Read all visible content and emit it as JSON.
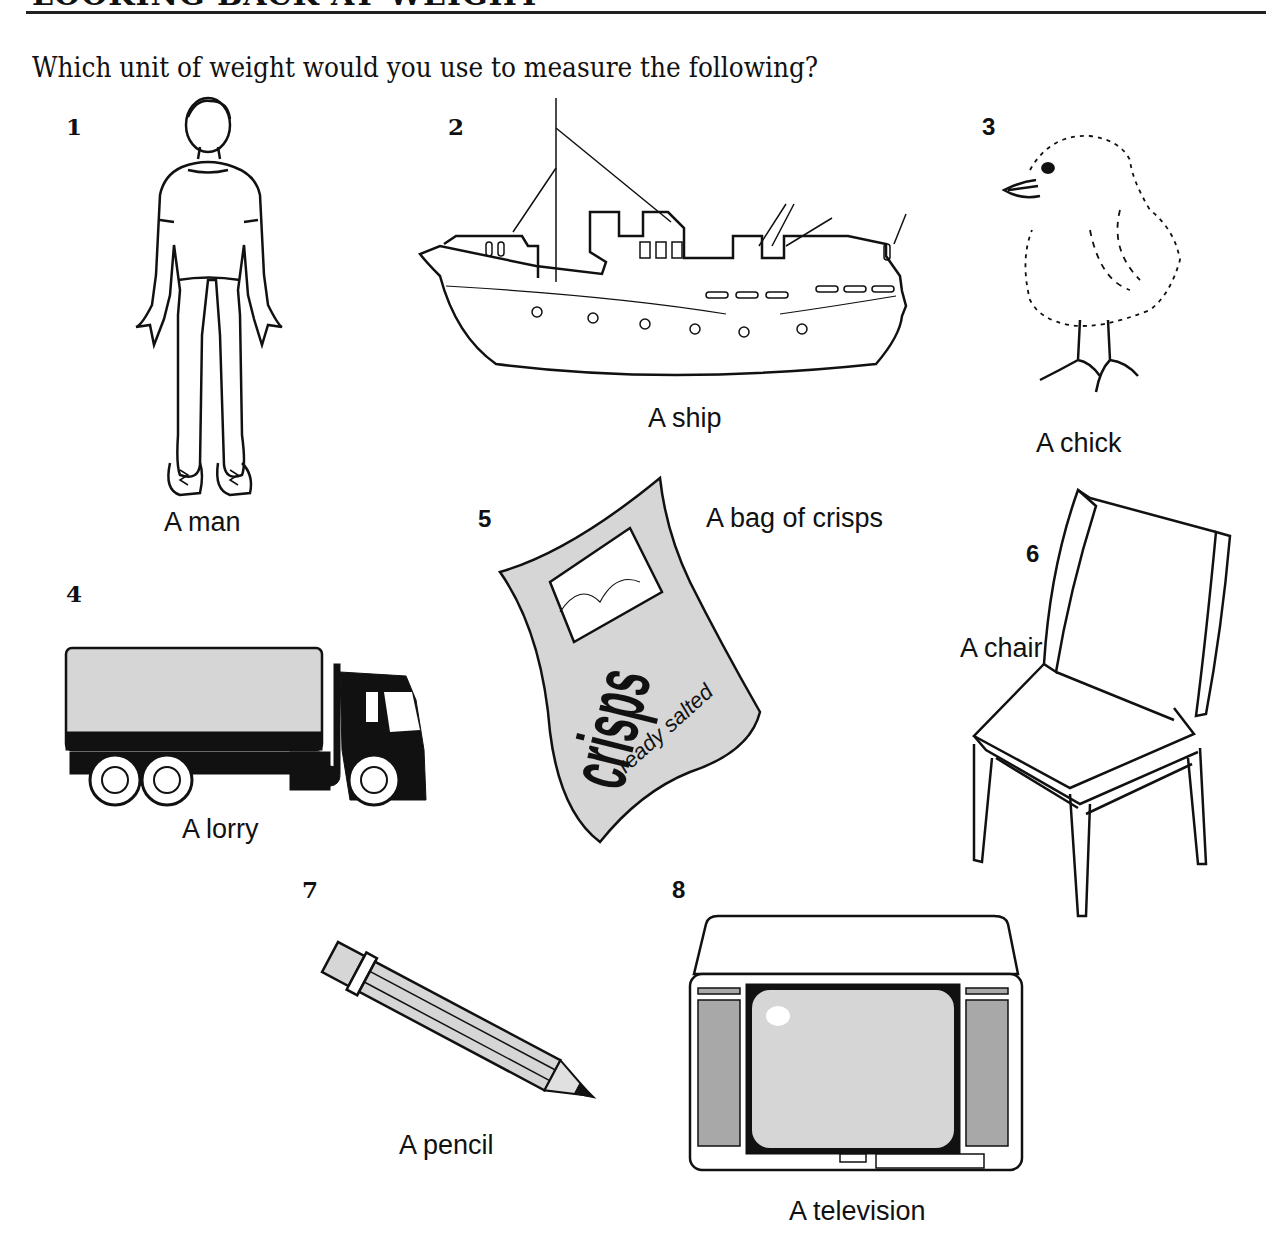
{
  "header": {
    "title": "LOOKING BACK AT WEIGHT",
    "question": "Which unit of weight would you use to measure the following?"
  },
  "items": [
    {
      "number": "1",
      "label": "A man",
      "icon": "man-figure"
    },
    {
      "number": "2",
      "label": "A ship",
      "icon": "ship"
    },
    {
      "number": "3",
      "label": "A chick",
      "icon": "chick"
    },
    {
      "number": "4",
      "label": "A lorry",
      "icon": "lorry"
    },
    {
      "number": "5",
      "label": "A bag of crisps",
      "icon": "crisps-bag",
      "packet_text": "crisps",
      "packet_subtext": "ready salted"
    },
    {
      "number": "6",
      "label": "A chair",
      "icon": "chair"
    },
    {
      "number": "7",
      "label": "A pencil",
      "icon": "pencil"
    },
    {
      "number": "8",
      "label": "A television",
      "icon": "television"
    }
  ],
  "colors": {
    "ink": "#111111",
    "grey_fill": "#d6d6d6",
    "dark_grey": "#a8a8a8"
  }
}
